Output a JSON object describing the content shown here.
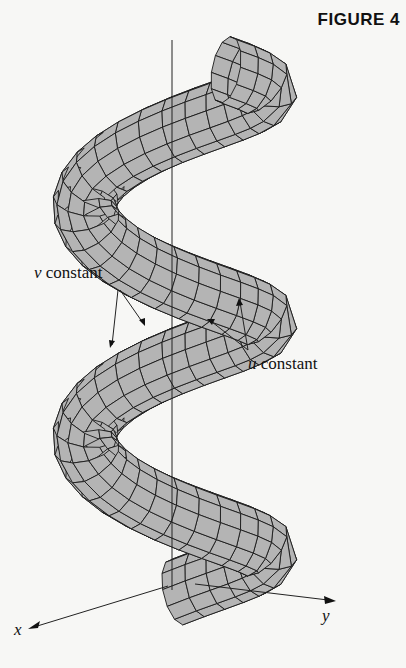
{
  "figure": {
    "title": "FIGURE 4",
    "surface_fill": "#b4b4b4",
    "grid_color": "#1a1a1a",
    "background": "#f7f7f5"
  },
  "labels": {
    "v_constant": {
      "var": "v",
      "text": " constant"
    },
    "u_constant": {
      "var": "u",
      "text": " constant"
    }
  },
  "axes": {
    "x_label": "x",
    "y_label": "y",
    "z_axis_visible": true,
    "z_label_visible": false
  },
  "helix": {
    "turns": 2.4,
    "tube_radius": 32,
    "helix_radius": 95,
    "u_divisions": 12,
    "v_divisions": 60
  }
}
